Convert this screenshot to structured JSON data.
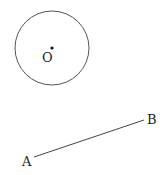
{
  "diagram": {
    "circle": {
      "cx": 52,
      "cy": 48,
      "r": 37,
      "stroke": "#555555"
    },
    "center_point": {
      "label": "O",
      "x": 52,
      "y": 48
    },
    "segment": {
      "start": {
        "label": "A",
        "x": 34,
        "y": 157
      },
      "end": {
        "label": "B",
        "x": 144,
        "y": 120
      },
      "stroke": "#444444"
    }
  }
}
